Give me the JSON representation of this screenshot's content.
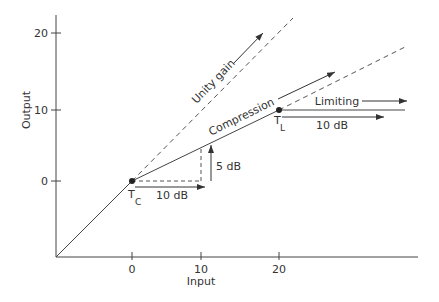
{
  "diagram": {
    "type": "compressor-limiter transfer characteristic",
    "axes": {
      "x_label": "Input",
      "y_label": "Output",
      "x_ticks": [
        "0",
        "10",
        "20"
      ],
      "y_ticks": [
        "20",
        "10",
        "0"
      ]
    },
    "points": {
      "compression_threshold": {
        "label": "T",
        "subscript": "C"
      },
      "limiting_threshold": {
        "label": "T",
        "subscript": "L"
      }
    },
    "labels": {
      "unity_gain": "Unity gain",
      "compression": "Compression",
      "limiting": "Limiting",
      "input_step_compression": "10 dB",
      "output_step_compression": "5 dB",
      "input_step_limiting": "10 dB"
    }
  }
}
